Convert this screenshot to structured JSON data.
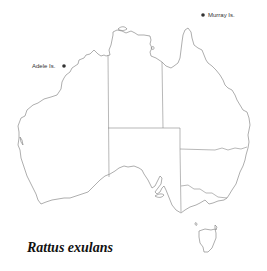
{
  "map": {
    "title": "Rattus exulans",
    "region": "Australia",
    "colors": {
      "outline": "#777777",
      "border": "#888888",
      "marker": "#333333",
      "background": "#ffffff"
    },
    "markers": [
      {
        "name": "Adele Is.",
        "label": "Adele Is.",
        "x": 64,
        "y": 66
      },
      {
        "name": "Murray Is.",
        "label": "Murray Is.",
        "x": 203,
        "y": 15
      }
    ]
  }
}
